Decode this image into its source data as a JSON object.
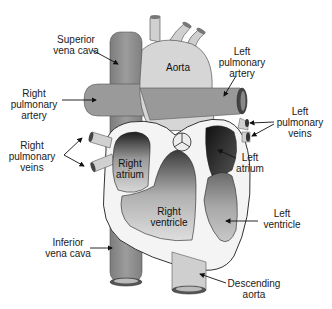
{
  "diagram": {
    "type": "anatomical-diagram",
    "colors": {
      "vessel_dark": "#8c8c8c",
      "vessel_mid": "#a9a9a9",
      "aorta_light": "#d4d4d4",
      "wall_white": "#f7f7f7",
      "chamber_dark": "#2a2a2a",
      "outline": "#222222"
    },
    "labels": {
      "superior_vena_cava": "Superior\nvena cava",
      "aorta": "Aorta",
      "left_pulmonary_artery": "Left\npulmonary\nartery",
      "right_pulmonary_artery": "Right\npulmonary\nartery",
      "left_pulmonary_veins": "Left\npulmonary\nveins",
      "right_pulmonary_veins": "Right\npulmonary\nveins",
      "right_atrium": "Right\natrium",
      "left_atrium": "Left\natrium",
      "right_ventricle": "Right\nventricle",
      "left_ventricle": "Left\nventricle",
      "inferior_vena_cava": "Inferior\nvena cava",
      "descending_aorta": "Descending\naorta"
    }
  }
}
